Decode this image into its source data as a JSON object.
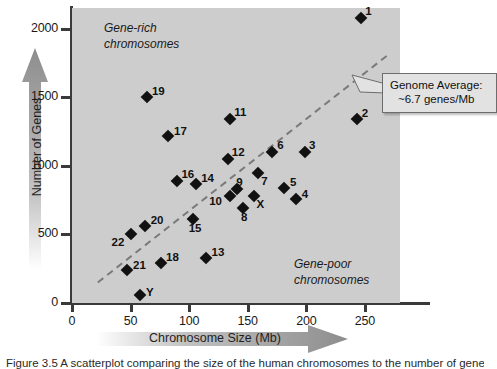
{
  "chart_data": {
    "type": "scatter",
    "title": "",
    "xlabel": "Chromosome Size (Mb)",
    "ylabel": "Number of Genes",
    "xlim": [
      0,
      280
    ],
    "ylim": [
      0,
      2150
    ],
    "xticks": [
      0,
      50,
      100,
      150,
      200,
      250
    ],
    "yticks": [
      0,
      500,
      1000,
      1500,
      2000
    ],
    "grid": false,
    "legend": "none",
    "plot_background": "#cdcdcd",
    "point_color": "#111111",
    "point_marker": "diamond",
    "points": [
      {
        "label": "1",
        "x": 247,
        "y": 2080
      },
      {
        "label": "2",
        "x": 243,
        "y": 1340
      },
      {
        "label": "3",
        "x": 199,
        "y": 1100
      },
      {
        "label": "4",
        "x": 191,
        "y": 760
      },
      {
        "label": "5",
        "x": 181,
        "y": 840
      },
      {
        "label": "6",
        "x": 171,
        "y": 1100
      },
      {
        "label": "7",
        "x": 159,
        "y": 950
      },
      {
        "label": "8",
        "x": 146,
        "y": 690
      },
      {
        "label": "9",
        "x": 141,
        "y": 830
      },
      {
        "label": "10",
        "x": 135,
        "y": 780
      },
      {
        "label": "11",
        "x": 135,
        "y": 1340
      },
      {
        "label": "12",
        "x": 133,
        "y": 1050
      },
      {
        "label": "13",
        "x": 114,
        "y": 330
      },
      {
        "label": "14",
        "x": 106,
        "y": 870
      },
      {
        "label": "15",
        "x": 103,
        "y": 610
      },
      {
        "label": "16",
        "x": 90,
        "y": 890
      },
      {
        "label": "17",
        "x": 82,
        "y": 1220
      },
      {
        "label": "18",
        "x": 76,
        "y": 290
      },
      {
        "label": "19",
        "x": 64,
        "y": 1500
      },
      {
        "label": "20",
        "x": 62,
        "y": 560
      },
      {
        "label": "21",
        "x": 47,
        "y": 240
      },
      {
        "label": "22",
        "x": 50,
        "y": 500
      },
      {
        "label": "X",
        "x": 155,
        "y": 780
      },
      {
        "label": "Y",
        "x": 58,
        "y": 60
      }
    ],
    "trendline": {
      "style": "dashed",
      "color": "#7a7a7a",
      "label": "Genome Average: ~6.7 genes/Mb",
      "x_start": 22,
      "y_start": 150,
      "x_end": 270,
      "y_end": 1810
    },
    "annotations": [
      {
        "name": "gene-rich",
        "line1": "Gene-rich",
        "line2": "chromosomes"
      },
      {
        "name": "gene-poor",
        "line1": "Gene-poor",
        "line2": "chromosomes"
      }
    ]
  },
  "axes": {
    "y": {
      "title": "Number of Genes",
      "ticks": [
        {
          "value": 2000,
          "label": "2000"
        },
        {
          "value": 1500,
          "label": "1500"
        },
        {
          "value": 1000,
          "label": "1000"
        },
        {
          "value": 500,
          "label": "500"
        },
        {
          "value": 0,
          "label": "0"
        }
      ]
    },
    "x": {
      "title": "Chromosome Size (Mb)",
      "ticks": [
        {
          "value": 0,
          "label": "0"
        },
        {
          "value": 50,
          "label": "50"
        },
        {
          "value": 100,
          "label": "100"
        },
        {
          "value": 150,
          "label": "150"
        },
        {
          "value": 200,
          "label": "200"
        },
        {
          "value": 250,
          "label": "250"
        }
      ]
    }
  },
  "callout": {
    "line1": "Genome Average:",
    "line2": "~6.7 genes/Mb"
  },
  "notes": {
    "gene_rich_line1": "Gene-rich",
    "gene_rich_line2": "chromosomes",
    "gene_poor_line1": "Gene-poor",
    "gene_poor_line2": "chromosomes"
  },
  "caption": "Figure 3.5  A scatterplot comparing the size of the human chromosomes to the number of genes they contain.",
  "colors": {
    "plot_background": "#cdcdcd",
    "axis": "#3a3a3a",
    "point": "#111111",
    "trendline": "#7a7a7a",
    "arrow": "#9a9a9a"
  }
}
